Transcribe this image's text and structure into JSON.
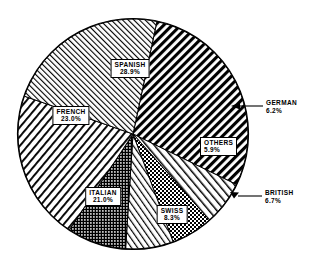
{
  "chart_data": {
    "type": "pie",
    "title": "",
    "subtitle": "",
    "xlabel": "",
    "ylabel": "",
    "legend_position": "none",
    "grid": false,
    "value_unit": "percent",
    "total": 100.0,
    "categories": [
      "SPANISH",
      "GERMAN",
      "OTHERS",
      "BRITISH",
      "SWISS",
      "ITALIAN",
      "FRENCH"
    ],
    "values": [
      28.9,
      6.2,
      5.9,
      6.7,
      8.3,
      21.0,
      23.0
    ],
    "labels": [
      "28.9%",
      "6.2%",
      "5.9%",
      "6.7%",
      "8.3%",
      "21.0%",
      "23.0%"
    ],
    "slices": [
      {
        "name": "SPANISH",
        "value": 28.9,
        "pct_text": "28.9%",
        "pattern": "thick-diagonal-black",
        "label_style": "inside-box"
      },
      {
        "name": "GERMAN",
        "value": 6.2,
        "pct_text": "6.2%",
        "pattern": "wide-diagonal-light",
        "label_style": "callout-right"
      },
      {
        "name": "OTHERS",
        "value": 5.9,
        "pct_text": "5.9%",
        "pattern": "checkered-dots",
        "label_style": "inside-box"
      },
      {
        "name": "BRITISH",
        "value": 6.7,
        "pct_text": "6.7%",
        "pattern": "fine-diagonal-light",
        "label_style": "callout-right"
      },
      {
        "name": "SWISS",
        "value": 8.3,
        "pct_text": "8.3%",
        "pattern": "dense-dark-dots",
        "label_style": "inside-box"
      },
      {
        "name": "ITALIAN",
        "value": 21.0,
        "pct_text": "21.0%",
        "pattern": "diagonal-stripes-right",
        "label_style": "inside-box"
      },
      {
        "name": "FRENCH",
        "value": 23.0,
        "pct_text": "23.0%",
        "pattern": "fine-diagonal-left",
        "label_style": "inside-box"
      }
    ]
  },
  "colors": {
    "stroke": "#000000",
    "background": "#ffffff",
    "fill_light": "#ffffff",
    "fill_dark": "#1a1a1a"
  }
}
